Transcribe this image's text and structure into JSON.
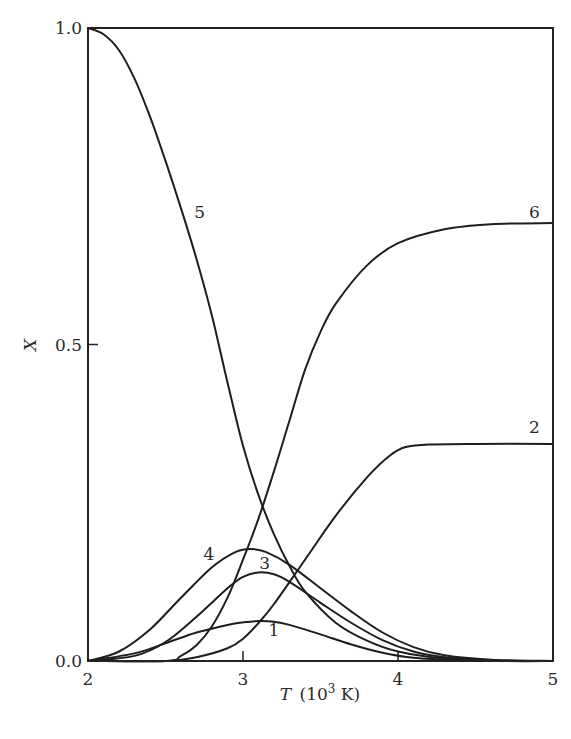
{
  "chart_data": {
    "type": "line",
    "title": "",
    "xlabel": "T (10^3 K)",
    "xlabel_parts": {
      "var": "T",
      "unit_pre": "(10",
      "sup": "3",
      "unit_post": " K)"
    },
    "ylabel": "X",
    "xlim": [
      2,
      5
    ],
    "ylim": [
      0,
      1.0
    ],
    "grid": false,
    "legend": "inline curve labels",
    "x_ticks": [
      2,
      3,
      4,
      5
    ],
    "x_tick_labels": [
      "2",
      "3",
      "4",
      "5"
    ],
    "y_ticks": [
      0.0,
      0.5,
      1.0
    ],
    "y_tick_labels": [
      "0.0",
      "0.5",
      "1.0"
    ],
    "series": [
      {
        "name": "1",
        "label_pos": [
          3.2,
          0.04
        ],
        "points": [
          [
            2.0,
            0.0
          ],
          [
            2.3,
            0.012
          ],
          [
            2.5,
            0.028
          ],
          [
            2.7,
            0.045
          ],
          [
            2.9,
            0.057
          ],
          [
            3.0,
            0.061
          ],
          [
            3.1,
            0.063
          ],
          [
            3.2,
            0.062
          ],
          [
            3.3,
            0.057
          ],
          [
            3.5,
            0.042
          ],
          [
            3.7,
            0.026
          ],
          [
            3.9,
            0.013
          ],
          [
            4.1,
            0.005
          ],
          [
            4.4,
            0.001
          ],
          [
            4.7,
            0.0
          ],
          [
            5.0,
            0.0
          ]
        ]
      },
      {
        "name": "2",
        "label_pos": [
          4.88,
          0.36
        ],
        "points": [
          [
            2.0,
            0.0
          ],
          [
            2.5,
            0.0
          ],
          [
            2.7,
            0.006
          ],
          [
            2.9,
            0.02
          ],
          [
            3.0,
            0.035
          ],
          [
            3.1,
            0.06
          ],
          [
            3.2,
            0.09
          ],
          [
            3.4,
            0.16
          ],
          [
            3.6,
            0.23
          ],
          [
            3.8,
            0.29
          ],
          [
            3.95,
            0.325
          ],
          [
            4.05,
            0.338
          ],
          [
            4.2,
            0.342
          ],
          [
            4.5,
            0.343
          ],
          [
            5.0,
            0.343
          ]
        ]
      },
      {
        "name": "3",
        "label_pos": [
          3.14,
          0.145
        ],
        "points": [
          [
            2.0,
            0.0
          ],
          [
            2.3,
            0.008
          ],
          [
            2.5,
            0.03
          ],
          [
            2.7,
            0.07
          ],
          [
            2.9,
            0.115
          ],
          [
            3.0,
            0.133
          ],
          [
            3.1,
            0.14
          ],
          [
            3.2,
            0.137
          ],
          [
            3.3,
            0.125
          ],
          [
            3.5,
            0.092
          ],
          [
            3.7,
            0.06
          ],
          [
            3.9,
            0.033
          ],
          [
            4.1,
            0.015
          ],
          [
            4.3,
            0.006
          ],
          [
            4.6,
            0.001
          ],
          [
            5.0,
            0.0
          ]
        ]
      },
      {
        "name": "4",
        "label_pos": [
          2.78,
          0.16
        ],
        "points": [
          [
            2.0,
            0.0
          ],
          [
            2.2,
            0.015
          ],
          [
            2.4,
            0.05
          ],
          [
            2.6,
            0.1
          ],
          [
            2.8,
            0.148
          ],
          [
            2.95,
            0.172
          ],
          [
            3.05,
            0.177
          ],
          [
            3.15,
            0.172
          ],
          [
            3.3,
            0.152
          ],
          [
            3.5,
            0.115
          ],
          [
            3.7,
            0.078
          ],
          [
            3.9,
            0.045
          ],
          [
            4.1,
            0.022
          ],
          [
            4.3,
            0.009
          ],
          [
            4.6,
            0.002
          ],
          [
            5.0,
            0.0
          ]
        ]
      },
      {
        "name": "5",
        "label_pos": [
          2.72,
          0.7
        ],
        "points": [
          [
            2.0,
            1.0
          ],
          [
            2.1,
            0.99
          ],
          [
            2.2,
            0.965
          ],
          [
            2.3,
            0.92
          ],
          [
            2.4,
            0.86
          ],
          [
            2.5,
            0.79
          ],
          [
            2.6,
            0.715
          ],
          [
            2.7,
            0.635
          ],
          [
            2.8,
            0.545
          ],
          [
            2.9,
            0.44
          ],
          [
            3.0,
            0.34
          ],
          [
            3.1,
            0.262
          ],
          [
            3.2,
            0.2
          ],
          [
            3.3,
            0.15
          ],
          [
            3.4,
            0.11
          ],
          [
            3.6,
            0.06
          ],
          [
            3.8,
            0.032
          ],
          [
            4.0,
            0.015
          ],
          [
            4.3,
            0.004
          ],
          [
            4.7,
            0.0
          ],
          [
            5.0,
            0.0
          ]
        ]
      },
      {
        "name": "6",
        "label_pos": [
          4.88,
          0.7
        ],
        "points": [
          [
            2.0,
            0.0
          ],
          [
            2.5,
            0.0
          ],
          [
            2.6,
            0.008
          ],
          [
            2.7,
            0.025
          ],
          [
            2.8,
            0.055
          ],
          [
            2.9,
            0.1
          ],
          [
            3.0,
            0.16
          ],
          [
            3.1,
            0.225
          ],
          [
            3.2,
            0.3
          ],
          [
            3.3,
            0.38
          ],
          [
            3.4,
            0.46
          ],
          [
            3.5,
            0.52
          ],
          [
            3.6,
            0.565
          ],
          [
            3.8,
            0.625
          ],
          [
            4.0,
            0.66
          ],
          [
            4.3,
            0.682
          ],
          [
            4.6,
            0.69
          ],
          [
            5.0,
            0.692
          ]
        ]
      }
    ]
  }
}
